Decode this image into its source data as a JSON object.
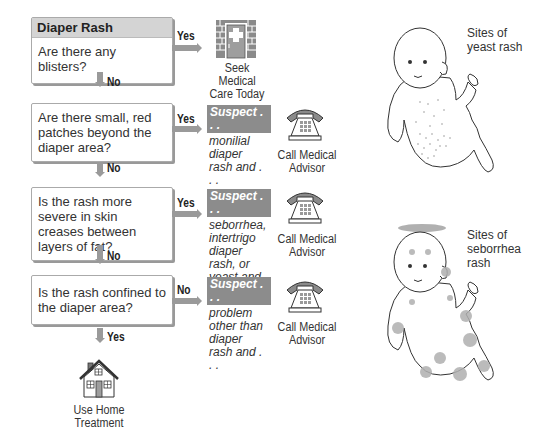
{
  "flowchart": {
    "title": "Diaper Rash",
    "questions": [
      {
        "text": "Are there any blisters?",
        "branch_right": "Yes",
        "branch_down": "No"
      },
      {
        "text": "Are there small, red patches beyond the diaper area?",
        "branch_right": "Yes",
        "branch_down": "No"
      },
      {
        "text": "Is the rash more severe in skin creases between layers of fat?",
        "branch_right": "Yes",
        "branch_down": "No"
      },
      {
        "text": "Is the rash confined to the diaper area?",
        "branch_right": "No",
        "branch_down": "Yes"
      }
    ],
    "outcomes": [
      {
        "icon": "hospital-door-icon",
        "label": "Seek Medical Care Today"
      },
      {
        "icon": "telephone-icon",
        "label": "Call Medical Advisor",
        "suspect_tag": "Suspect . . .",
        "suspect_text": "monilial diaper rash and . . ."
      },
      {
        "icon": "telephone-icon",
        "label": "Call Medical Advisor",
        "suspect_tag": "Suspect . . .",
        "suspect_text": "seborrhea, intertrigo diaper rash, or yeast and . . ."
      },
      {
        "icon": "telephone-icon",
        "label": "Call Medical Advisor",
        "suspect_tag": "Suspect . . .",
        "suspect_text": "problem other than diaper rash and . . ."
      },
      {
        "icon": "house-icon",
        "label": "Use Home Treatment"
      }
    ]
  },
  "illustrations": [
    {
      "name": "baby-yeast-rash",
      "caption": "Sites of yeast rash"
    },
    {
      "name": "baby-seborrhea-rash",
      "caption": "Sites of seborrhea rash"
    }
  ],
  "colors": {
    "header_bg": "#d4d4d4",
    "arrow": "#9a9a9a",
    "suspect_tag_bg": "#8c8c8c",
    "rash_spot": "#b0b0b0"
  }
}
